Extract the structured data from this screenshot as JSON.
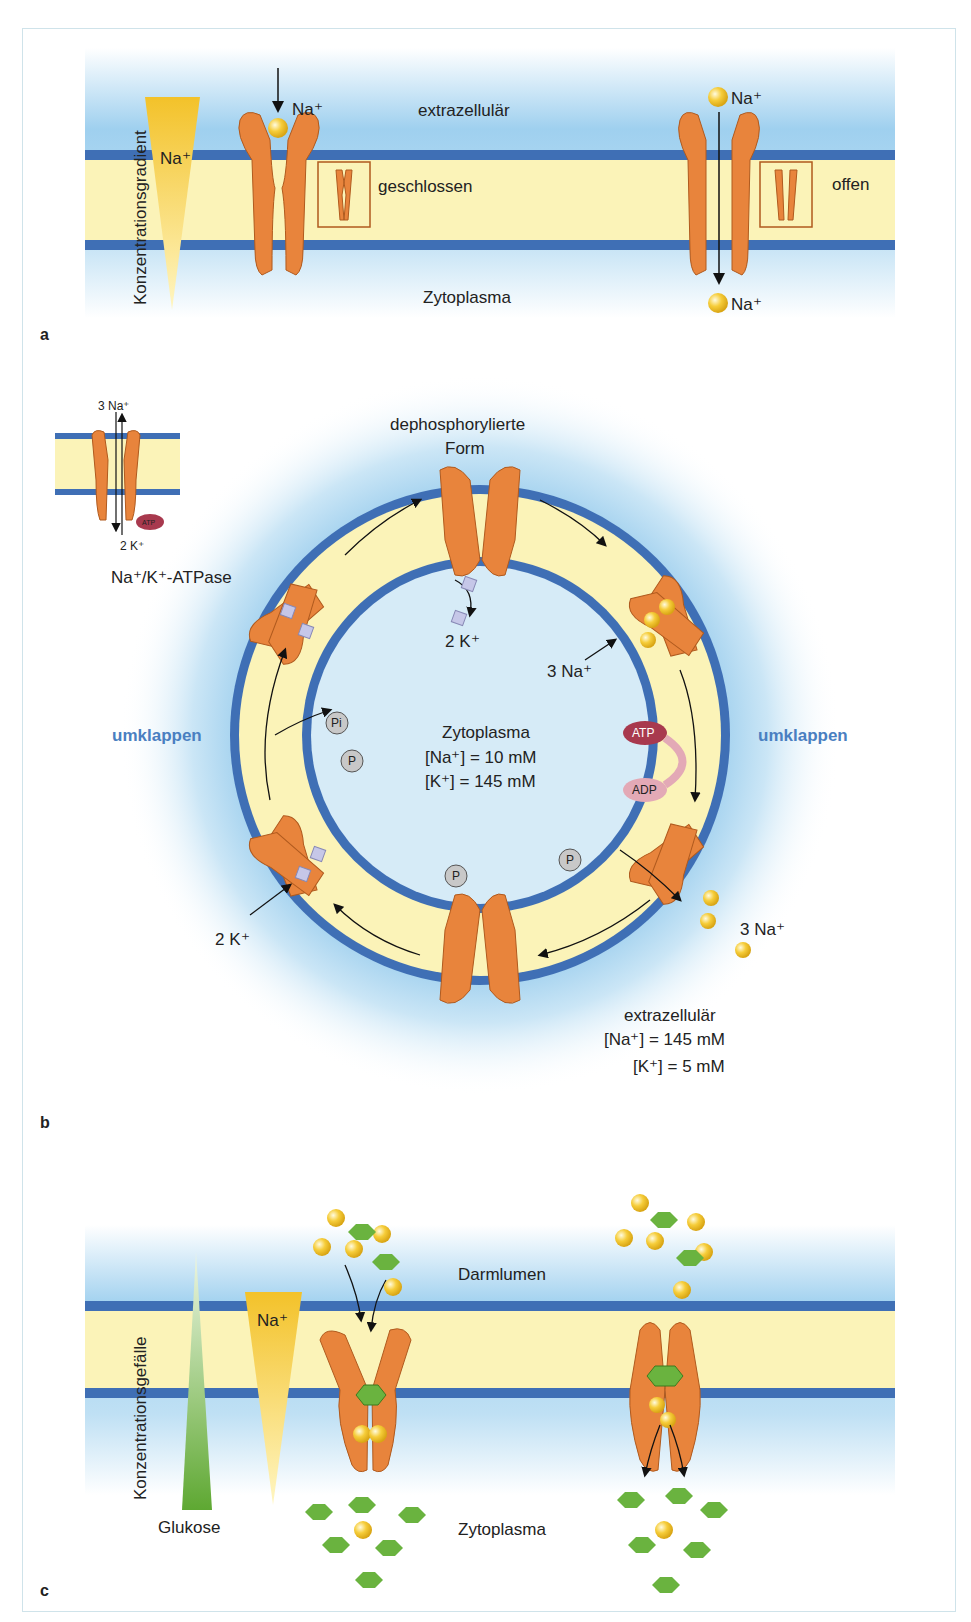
{
  "panel_a": {
    "letter": "a",
    "gradient_label": "Konzentrationsgradient",
    "gradient_ion": "Na⁺",
    "ion_top_left": "Na⁺",
    "extracellular": "extrazellulär",
    "cytoplasm": "Zytoplasma",
    "closed_label": "geschlossen",
    "open_label": "offen",
    "ion_top_right": "Na⁺",
    "ion_bottom_right": "Na⁺"
  },
  "panel_b": {
    "letter": "b",
    "inset_top": "3 Na⁺",
    "inset_bottom": "2 K⁺",
    "inset_atp": "ATP",
    "pump_name": "Na⁺/K⁺-ATPase",
    "top_label_line1": "dephosphorylierte",
    "top_label_line2": "Form",
    "k_in": "2 K⁺",
    "na_in": "3 Na⁺",
    "flip_left": "umklappen",
    "flip_right": "umklappen",
    "cyto_title": "Zytoplasma",
    "cyto_na": "[Na⁺] = 10 mM",
    "cyto_k": "[K⁺] = 145 mM",
    "atp": "ATP",
    "adp": "ADP",
    "pi": "Pi",
    "p": "P",
    "na_out": "3 Na⁺",
    "k_left": "2 K⁺",
    "extra_title": "extrazellulär",
    "extra_na": "[Na⁺] = 145 mM",
    "extra_k": "[K⁺] = 5 mM"
  },
  "panel_c": {
    "letter": "c",
    "gradient_label": "Konzentrationsgefälle",
    "gradient_ion": "Na⁺",
    "glucose_label": "Glukose",
    "lumen": "Darmlumen",
    "cytoplasm": "Zytoplasma"
  },
  "colors": {
    "membrane_blue": "#3f6fb5",
    "membrane_core": "#fbf3b8",
    "protein_orange": "#e8843c",
    "sodium_yellow": "#f3c22a",
    "glucose_green": "#6ab33f",
    "flip_text": "#4a7fc1",
    "atp_red": "#a8394e",
    "adp_pink": "#e3a9b6"
  }
}
